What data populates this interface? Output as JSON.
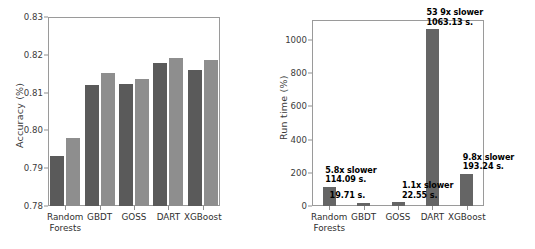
{
  "chart_data": [
    {
      "type": "bar",
      "id": "accuracy",
      "title": "",
      "xlabel": "",
      "ylabel": "Accuracy (%)",
      "ylim": [
        0.78,
        0.83
      ],
      "yticks": [
        "0.78",
        "0.79",
        "0.80",
        "0.81",
        "0.82",
        "0.83"
      ],
      "ytick_values": [
        0.78,
        0.79,
        0.8,
        0.81,
        0.82,
        0.83
      ],
      "grid": false,
      "legend": "none",
      "categories": [
        "Random\nForests",
        "GBDT",
        "GOSS",
        "DART",
        "XGBoost"
      ],
      "category_labels": [
        [
          "Random",
          "Forests"
        ],
        [
          "GBDT"
        ],
        [
          "GOSS"
        ],
        [
          "DART"
        ],
        [
          "XGBoost"
        ]
      ],
      "series": [
        {
          "name": "series-dark",
          "color": "#5a5a5a",
          "values": [
            0.7931,
            0.812,
            0.8123,
            0.8178,
            0.8159
          ]
        },
        {
          "name": "series-light",
          "color": "#8e8e8e",
          "values": [
            0.7981,
            0.8153,
            0.8137,
            0.8191,
            0.8187
          ]
        }
      ]
    },
    {
      "type": "bar",
      "id": "runtime",
      "title": "",
      "xlabel": "",
      "ylabel": "Run time (%)",
      "ylim": [
        0,
        1120
      ],
      "yticks": [
        "0",
        "200",
        "400",
        "600",
        "800",
        "1000"
      ],
      "ytick_values": [
        0,
        200,
        400,
        600,
        800,
        1000
      ],
      "grid": false,
      "legend": "none",
      "categories": [
        "Random\nForests",
        "GBDT",
        "GOSS",
        "DART",
        "XGBoost"
      ],
      "category_labels": [
        [
          "Random",
          "Forests"
        ],
        [
          "GBDT"
        ],
        [
          "GOSS"
        ],
        [
          "DART"
        ],
        [
          "XGBoost"
        ]
      ],
      "series": [
        {
          "name": "runtime-bars",
          "color": "#656565",
          "values": [
            114.09,
            19.71,
            22.55,
            1063.13,
            193.24
          ]
        }
      ],
      "annotations": [
        {
          "category": "Random Forests",
          "lines": [
            "5.8x slower",
            "114.09 s."
          ]
        },
        {
          "category": "GBDT",
          "lines": [
            "19.71 s."
          ]
        },
        {
          "category": "GOSS",
          "lines": [
            "1.1x slower",
            "22.55 s."
          ]
        },
        {
          "category": "DART",
          "lines": [
            "53 9x slower",
            "1063.13 s."
          ]
        },
        {
          "category": "XGBoost",
          "lines": [
            "9.8x slower",
            "193.24 s."
          ]
        }
      ]
    }
  ],
  "accuracy_panel": {
    "ylabel": "Accuracy (%)",
    "yticks": [
      "0.83",
      "0.82",
      "0.81",
      "0.80",
      "0.79",
      "0.78"
    ],
    "xlabels": [
      {
        "line1": "Random",
        "line2": "Forests"
      },
      {
        "line1": "GBDT",
        "line2": ""
      },
      {
        "line1": "GOSS",
        "line2": ""
      },
      {
        "line1": "DART",
        "line2": ""
      },
      {
        "line1": "XGBoost",
        "line2": ""
      }
    ]
  },
  "runtime_panel": {
    "ylabel": "Run time (%)",
    "yticks": [
      "1000",
      "800",
      "600",
      "400",
      "200",
      "0"
    ],
    "xlabels": [
      {
        "line1": "Random",
        "line2": "Forests"
      },
      {
        "line1": "GBDT",
        "line2": ""
      },
      {
        "line1": "GOSS",
        "line2": ""
      },
      {
        "line1": "DART",
        "line2": ""
      },
      {
        "line1": "XGBoost",
        "line2": ""
      }
    ],
    "annotations": [
      {
        "l1": "5.8x slower",
        "l2": "114.09 s."
      },
      {
        "l1": "",
        "l2": "19.71 s."
      },
      {
        "l1": "1.1x slower",
        "l2": "22.55 s."
      },
      {
        "l1": "53 9x slower",
        "l2": "1063.13 s."
      },
      {
        "l1": "9.8x slower",
        "l2": "193.24 s."
      }
    ]
  },
  "colors": {
    "bar_dark": "#5a5a5a",
    "bar_light": "#8e8e8e",
    "bar_runtime": "#656565",
    "axis": "#9a9a9a",
    "text": "#2f2f2f",
    "background": "#ffffff"
  }
}
